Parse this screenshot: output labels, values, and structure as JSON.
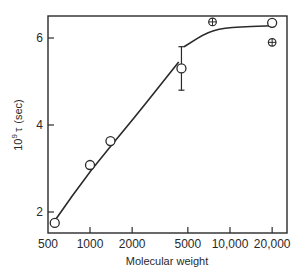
{
  "chart_data": {
    "type": "scatter",
    "title": "",
    "xlabel": "Molecular weight",
    "ylabel": "10^9 τ (sec)",
    "ylabel_parts": {
      "base": "10",
      "exp": "9",
      "symbol": "τ",
      "unit": "(sec)"
    },
    "xscale": "log",
    "xlim": [
      500,
      22000
    ],
    "ylim": [
      1.5,
      6.5
    ],
    "xticks": [
      500,
      1000,
      2000,
      5000,
      10000,
      20000
    ],
    "xtick_labels": [
      "500",
      "1000",
      "2000",
      "5000",
      "10,000",
      "20,000"
    ],
    "yticks": [
      2,
      4,
      6
    ],
    "ytick_labels": [
      "2",
      "4",
      "6"
    ],
    "grid": false,
    "legend": null,
    "series": [
      {
        "name": "open circles",
        "marker": "open-circle",
        "points": [
          {
            "x": 560,
            "y": 1.75
          },
          {
            "x": 1000,
            "y": 3.08
          },
          {
            "x": 1400,
            "y": 3.63
          },
          {
            "x": 4500,
            "y": 5.3,
            "yerr_low": 4.8,
            "yerr_high": 5.8
          },
          {
            "x": 20000,
            "y": 6.35
          }
        ]
      },
      {
        "name": "crossed circles",
        "marker": "circle-plus",
        "points": [
          {
            "x": 7500,
            "y": 6.37
          },
          {
            "x": 20000,
            "y": 5.9
          }
        ]
      },
      {
        "name": "fitted curve",
        "marker": "line",
        "points": [
          {
            "x": 560,
            "y": 1.8
          },
          {
            "x": 1000,
            "y": 2.95
          },
          {
            "x": 2000,
            "y": 4.1
          },
          {
            "x": 4300,
            "y": 5.45
          },
          {
            "x": 4700,
            "y": 5.8
          },
          {
            "x": 7000,
            "y": 6.15
          },
          {
            "x": 10000,
            "y": 6.25
          },
          {
            "x": 20000,
            "y": 6.28
          }
        ]
      }
    ]
  }
}
